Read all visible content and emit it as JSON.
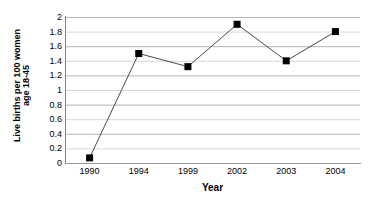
{
  "chart_data": {
    "type": "line",
    "title": "",
    "xlabel": "Year",
    "ylabel": "Live births per 100 women age 18-45",
    "ylabel_lines": [
      "Live births per 100 women",
      "age 18-45"
    ],
    "categories": [
      "1990",
      "1994",
      "1999",
      "2002",
      "2003",
      "2004"
    ],
    "values": [
      0.07,
      1.5,
      1.32,
      1.9,
      1.4,
      1.8
    ],
    "series": [
      {
        "name": "Live births per 100 women age 18-45",
        "values": [
          0.07,
          1.5,
          1.32,
          1.9,
          1.4,
          1.8
        ]
      }
    ],
    "ylim": [
      0,
      2
    ],
    "ytick_labels": [
      "0",
      "0.2",
      "0.4",
      "0.6",
      "0.8",
      "1",
      "1.2",
      "1.4",
      "1.6",
      "1.8",
      "2"
    ],
    "ytick_values": [
      0,
      0.2,
      0.4,
      0.6,
      0.8,
      1,
      1.2,
      1.4,
      1.6,
      1.8,
      2
    ],
    "grid": true,
    "grid_axis": "y",
    "legend": false,
    "legend_position": "none",
    "marker": "square",
    "marker_color": "#000000",
    "line_color": "#4a4a4a",
    "gridline_color": "#c8c8c8",
    "axis_color": "#808080",
    "background_color": "#ffffff"
  }
}
